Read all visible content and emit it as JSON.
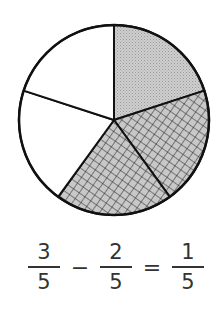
{
  "diagram": {
    "type": "fraction-pie",
    "center": [
      114,
      120
    ],
    "radius": 95,
    "slices_total": 5,
    "slices": [
      {
        "index": 1,
        "fill": "dotted-gray",
        "color": "#c4c4c4"
      },
      {
        "index": 2,
        "fill": "crosshatch",
        "color": "#bdbdbd"
      },
      {
        "index": 3,
        "fill": "crosshatch",
        "color": "#bdbdbd"
      },
      {
        "index": 4,
        "fill": "white",
        "color": "#ffffff"
      },
      {
        "index": 5,
        "fill": "white",
        "color": "#ffffff"
      }
    ]
  },
  "equation": {
    "left": {
      "numerator": "3",
      "denominator": "5"
    },
    "operator": "−",
    "right": {
      "numerator": "2",
      "denominator": "5"
    },
    "equals": "=",
    "result": {
      "numerator": "1",
      "denominator": "5"
    }
  }
}
